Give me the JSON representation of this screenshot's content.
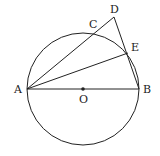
{
  "figure": {
    "type": "geometry",
    "circle": {
      "center": "O",
      "cx": 83,
      "cy": 89,
      "r": 56
    },
    "points": {
      "A": {
        "label": "A",
        "x": 27,
        "y": 89
      },
      "B": {
        "label": "B",
        "x": 139,
        "y": 89
      },
      "O": {
        "label": "O",
        "x": 83,
        "y": 89
      },
      "C": {
        "label": "C",
        "x": 96,
        "y": 33
      },
      "D": {
        "label": "D",
        "x": 114,
        "y": 17
      },
      "E": {
        "label": "E",
        "x": 128,
        "y": 53
      }
    },
    "segments": [
      [
        "A",
        "B"
      ],
      [
        "A",
        "D"
      ],
      [
        "A",
        "E"
      ],
      [
        "D",
        "B"
      ]
    ],
    "stroke_color": "#222222"
  }
}
